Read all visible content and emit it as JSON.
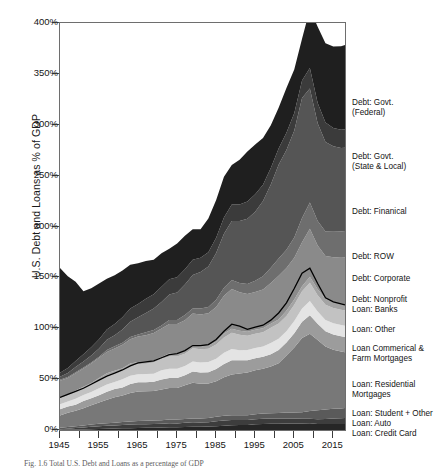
{
  "axes": {
    "ylabel": "U.S. Debt and Loans as % of GDP",
    "yticks": [
      "0%",
      "50%",
      "100%",
      "150%",
      "200%",
      "250%",
      "300%",
      "350%",
      "400%"
    ],
    "ytick_values": [
      0,
      50,
      100,
      150,
      200,
      250,
      300,
      350,
      400
    ],
    "xticks": [
      "1945",
      "1955",
      "1965",
      "1975",
      "1985",
      "1995",
      "2005",
      "2015"
    ],
    "xtick_values": [
      1945,
      1955,
      1965,
      1975,
      1985,
      1995,
      2005,
      2015
    ]
  },
  "caption": "Fig. 1.6  Total U.S. Debt and Loans as a percentage of GDP",
  "legend": [
    {
      "label": "Debt: Govt.\n(Federal)",
      "top": 98,
      "color": "#1f1f1f"
    },
    {
      "label": "Debt: Govt.\n(State & Local)",
      "top": 152,
      "color": "#3b3b3b"
    },
    {
      "label": "Debt: Finanical",
      "top": 207,
      "color": "#555555"
    },
    {
      "label": "Debt: ROW",
      "top": 252,
      "color": "#6e6e6e"
    },
    {
      "label": "Debt: Corporate",
      "top": 274,
      "color": "#8a8a8a"
    },
    {
      "label": "Debt: Nonprofit",
      "top": 295,
      "color": "#a3a3a3"
    },
    {
      "label": "Loan: Banks",
      "top": 305,
      "color": "#c2c2c2"
    },
    {
      "label": "Loan: Other",
      "top": 325,
      "color": "#e4e4e4"
    },
    {
      "label": "Loan Commerical &\nFarm Mortgages",
      "top": 344,
      "color": "#9c9c9c"
    },
    {
      "label": "Loan: Residential\nMortgages",
      "top": 380,
      "color": "#787878"
    },
    {
      "label": "Loan: Student + Other",
      "top": 409,
      "color": "#5a5a5a"
    },
    {
      "label": "Loan: Auto",
      "top": 419,
      "color": "#3d3d3d"
    },
    {
      "label": "Loan: Credit Card",
      "top": 429,
      "color": "#262626"
    }
  ],
  "chart_data": {
    "type": "area",
    "title": "",
    "xlabel": "",
    "ylabel": "U.S. Debt and Loans as % of GDP",
    "xlim": [
      1945,
      2018
    ],
    "ylim": [
      0,
      400
    ],
    "grid": false,
    "legend_position": "right",
    "stacked": true,
    "x": [
      1945,
      1947,
      1949,
      1951,
      1953,
      1955,
      1957,
      1959,
      1961,
      1963,
      1965,
      1967,
      1969,
      1971,
      1973,
      1975,
      1977,
      1979,
      1981,
      1983,
      1985,
      1987,
      1989,
      1991,
      1993,
      1995,
      1997,
      1999,
      2001,
      2003,
      2005,
      2007,
      2009,
      2011,
      2013,
      2015,
      2017,
      2018
    ],
    "series": [
      {
        "name": "Loan: Credit Card",
        "color": "#262626",
        "values": [
          0.3,
          0.4,
          0.5,
          0.6,
          0.8,
          1.0,
          1.2,
          1.4,
          1.6,
          1.8,
          2.0,
          2.1,
          2.3,
          2.4,
          2.6,
          2.7,
          2.9,
          3.1,
          3.2,
          3.4,
          3.8,
          4.2,
          4.6,
          4.8,
          5.0,
          5.6,
          6.0,
          6.1,
          6.2,
          6.3,
          6.3,
          6.4,
          6.6,
          6.0,
          5.8,
          5.8,
          5.9,
          6.0
        ]
      },
      {
        "name": "Loan: Auto",
        "color": "#3d3d3d",
        "values": [
          0.5,
          0.9,
          1.4,
          1.8,
          2.3,
          2.7,
          2.9,
          3.1,
          3.3,
          3.5,
          3.7,
          3.6,
          3.7,
          3.8,
          4.0,
          3.8,
          4.2,
          4.4,
          4.2,
          4.3,
          4.9,
          5.2,
          5.3,
          5.0,
          4.8,
          5.0,
          5.0,
          5.1,
          5.0,
          5.0,
          4.9,
          4.7,
          4.5,
          4.6,
          5.0,
          5.6,
          5.7,
          5.8
        ]
      },
      {
        "name": "Loan: Student + Other",
        "color": "#5a5a5a",
        "values": [
          1.5,
          1.7,
          1.9,
          2.0,
          2.2,
          2.4,
          2.6,
          2.7,
          2.9,
          3.0,
          3.2,
          3.3,
          3.4,
          3.5,
          3.6,
          3.7,
          3.8,
          3.9,
          4.0,
          4.1,
          4.3,
          4.5,
          4.6,
          4.7,
          4.8,
          5.0,
          5.1,
          5.2,
          5.4,
          5.8,
          6.0,
          6.3,
          7.6,
          8.8,
          9.3,
          9.5,
          9.6,
          9.7
        ]
      },
      {
        "name": "Loan: Residential Mortgages",
        "color": "#787878",
        "values": [
          12,
          14,
          15,
          17,
          19,
          21,
          23,
          25,
          26,
          28,
          29,
          29,
          29,
          30,
          31,
          31,
          33,
          35,
          34,
          34,
          35,
          38,
          40,
          41,
          42,
          43,
          44,
          46,
          49,
          56,
          64,
          73,
          76,
          69,
          62,
          58,
          56,
          55
        ]
      },
      {
        "name": "Loan Commerical & Farm Mortgages",
        "color": "#9c9c9c",
        "values": [
          6,
          6,
          6,
          7,
          7,
          7,
          8,
          8,
          8,
          9,
          9,
          9,
          9,
          10,
          10,
          10,
          10,
          11,
          11,
          11,
          12,
          13,
          14,
          13,
          12,
          12,
          12,
          12,
          13,
          13,
          14,
          16,
          18,
          16,
          15,
          15,
          15,
          15
        ]
      },
      {
        "name": "Loan: Other",
        "color": "#e4e4e4",
        "values": [
          5,
          5,
          6,
          6,
          6,
          7,
          7,
          7,
          8,
          8,
          8,
          8,
          8,
          9,
          9,
          9,
          9,
          10,
          10,
          10,
          10,
          11,
          11,
          10,
          10,
          10,
          10,
          11,
          11,
          11,
          12,
          13,
          14,
          12,
          11,
          11,
          11,
          11
        ]
      },
      {
        "name": "Loan: Banks",
        "color": "#c2c2c2",
        "values": [
          6,
          6,
          7,
          7,
          8,
          8,
          9,
          9,
          9,
          10,
          10,
          10,
          11,
          11,
          12,
          12,
          12,
          13,
          13,
          13,
          14,
          15,
          16,
          15,
          14,
          14,
          14,
          15,
          15,
          15,
          16,
          17,
          18,
          16,
          15,
          15,
          15,
          15
        ]
      },
      {
        "name": "Debt: Nonprofit",
        "color": "#a3a3a3",
        "values": [
          1,
          1,
          1,
          1,
          1,
          2,
          2,
          2,
          2,
          2,
          2,
          2,
          2,
          2,
          3,
          3,
          3,
          3,
          3,
          3,
          3,
          4,
          4,
          4,
          4,
          4,
          4,
          4,
          4,
          5,
          5,
          5,
          6,
          6,
          6,
          6,
          6,
          6
        ]
      },
      {
        "name": "Debt: Corporate",
        "color": "#8a8a8a",
        "values": [
          16,
          16,
          17,
          18,
          19,
          20,
          21,
          22,
          23,
          24,
          25,
          26,
          27,
          28,
          29,
          29,
          30,
          31,
          31,
          32,
          34,
          37,
          39,
          38,
          37,
          37,
          38,
          40,
          43,
          42,
          41,
          43,
          47,
          43,
          42,
          44,
          45,
          46
        ]
      },
      {
        "name": "Debt: ROW",
        "color": "#6e6e6e",
        "values": [
          1,
          1,
          1,
          1,
          1,
          1,
          2,
          2,
          2,
          2,
          2,
          3,
          3,
          3,
          4,
          4,
          5,
          5,
          6,
          6,
          7,
          8,
          9,
          9,
          10,
          11,
          13,
          15,
          17,
          18,
          20,
          24,
          26,
          24,
          24,
          25,
          26,
          26
        ]
      },
      {
        "name": "Debt: Finanical",
        "color": "#555555",
        "values": [
          3,
          4,
          5,
          6,
          7,
          8,
          10,
          11,
          13,
          15,
          17,
          19,
          21,
          23,
          25,
          27,
          30,
          33,
          36,
          40,
          46,
          53,
          58,
          61,
          64,
          68,
          74,
          82,
          92,
          98,
          105,
          118,
          112,
          96,
          88,
          84,
          82,
          82
        ]
      },
      {
        "name": "Debt: Govt. (State & Local)",
        "color": "#3b3b3b",
        "values": [
          4,
          5,
          6,
          7,
          8,
          9,
          10,
          11,
          12,
          13,
          13,
          14,
          14,
          15,
          15,
          15,
          15,
          15,
          14,
          14,
          15,
          16,
          16,
          16,
          17,
          17,
          16,
          16,
          16,
          17,
          17,
          17,
          20,
          20,
          19,
          18,
          18,
          18
        ]
      },
      {
        "name": "Debt: Govt. (Federal)",
        "color": "#1f1f1f",
        "values": [
          103,
          90,
          78,
          62,
          58,
          55,
          50,
          48,
          46,
          43,
          40,
          37,
          34,
          33,
          30,
          33,
          33,
          30,
          28,
          33,
          37,
          40,
          39,
          44,
          49,
          49,
          46,
          42,
          40,
          44,
          43,
          41,
          58,
          75,
          78,
          80,
          82,
          83
        ]
      }
    ],
    "overlay_line": {
      "name": "total-loans-line",
      "color": "#000000",
      "description": "Black outline marking the top of the Loan: Banks band (total loans).",
      "values": [
        32,
        35,
        38,
        41,
        45,
        49,
        53,
        56,
        59,
        63,
        66,
        67,
        68,
        71,
        74,
        75,
        78,
        83,
        83,
        84,
        89,
        97,
        104,
        102,
        99,
        101,
        103,
        108,
        115,
        125,
        139,
        154,
        159,
        144,
        130,
        126,
        124,
        123
      ]
    }
  }
}
